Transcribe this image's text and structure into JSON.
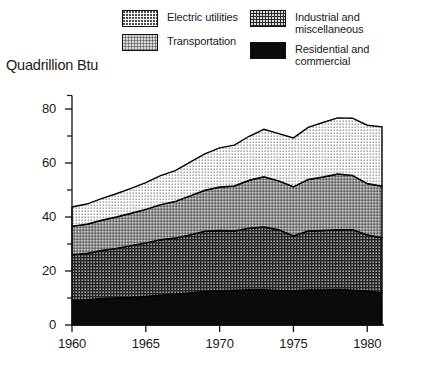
{
  "axis_title": "Quadrillion Btu",
  "legend": {
    "columns": [
      {
        "entries": [
          {
            "label": "Electric utilities",
            "pattern": "pat-electric",
            "name": "legend-swatch-electric-utilities"
          },
          {
            "label": "Transportation",
            "pattern": "pat-transport",
            "name": "legend-swatch-transportation"
          }
        ]
      },
      {
        "entries": [
          {
            "label": "Industrial and\nmiscellaneous",
            "pattern": "pat-industrial",
            "name": "legend-swatch-industrial"
          },
          {
            "label": "Residential and\ncommercial",
            "pattern": "pat-residential",
            "name": "legend-swatch-residential"
          }
        ]
      }
    ]
  },
  "chart_data": {
    "type": "area",
    "stacked": true,
    "title": "",
    "xlabel": "",
    "ylabel": "Quadrillion Btu",
    "xlim": [
      1960,
      1981
    ],
    "ylim": [
      0,
      85
    ],
    "grid": false,
    "legend_position": "top",
    "x_major_ticks": [
      1960,
      1965,
      1970,
      1975,
      1980
    ],
    "x_tick_labels": [
      "1960",
      "1965",
      "1970",
      "1975",
      "1980"
    ],
    "y_major_ticks": [
      0,
      20,
      40,
      60,
      80
    ],
    "y_tick_labels": [
      "0",
      "20",
      "40",
      "60",
      "80"
    ],
    "y_minor_ticks": [
      10,
      30,
      50,
      70
    ],
    "x": [
      1960,
      1961,
      1962,
      1963,
      1964,
      1965,
      1966,
      1967,
      1968,
      1969,
      1970,
      1971,
      1972,
      1973,
      1974,
      1975,
      1976,
      1977,
      1978,
      1979,
      1980,
      1981
    ],
    "series": [
      {
        "name": "Residential and commercial",
        "color": "#0b0b0b",
        "values": [
          9.0,
          9.3,
          9.8,
          10.0,
          10.2,
          10.6,
          11.0,
          11.4,
          11.9,
          12.4,
          12.6,
          12.8,
          13.1,
          13.1,
          12.7,
          12.6,
          13.0,
          13.0,
          13.2,
          12.9,
          12.5,
          12.0
        ]
      },
      {
        "name": "Industrial and miscellaneous",
        "color": "#2a2a2a",
        "values": [
          17.0,
          17.2,
          17.8,
          18.4,
          19.2,
          19.8,
          20.6,
          20.8,
          21.5,
          22.3,
          22.4,
          22.0,
          22.8,
          23.2,
          22.6,
          20.4,
          21.8,
          22.0,
          22.1,
          22.4,
          20.9,
          20.3
        ]
      },
      {
        "name": "Transportation",
        "color": "#8e8e8e",
        "values": [
          10.6,
          10.8,
          11.2,
          11.6,
          12.0,
          12.4,
          13.0,
          13.6,
          14.4,
          15.2,
          16.1,
          16.7,
          17.7,
          18.6,
          18.1,
          18.2,
          19.1,
          19.8,
          20.6,
          20.1,
          19.0,
          19.1
        ]
      },
      {
        "name": "Electric utilities",
        "color": "#ffffff",
        "values": [
          7.1,
          7.5,
          8.0,
          8.6,
          9.2,
          9.9,
          10.7,
          11.4,
          12.5,
          13.5,
          14.5,
          15.1,
          16.3,
          17.6,
          17.5,
          18.1,
          19.3,
          20.2,
          20.8,
          21.2,
          21.6,
          22.0
        ]
      }
    ],
    "totals": [
      43.7,
      44.8,
      46.8,
      48.6,
      50.6,
      52.7,
      55.3,
      57.2,
      60.3,
      63.4,
      65.6,
      66.6,
      69.9,
      74.5,
      70.9,
      69.3,
      73.2,
      75.0,
      76.7,
      76.6,
      74.0,
      73.4
    ]
  }
}
